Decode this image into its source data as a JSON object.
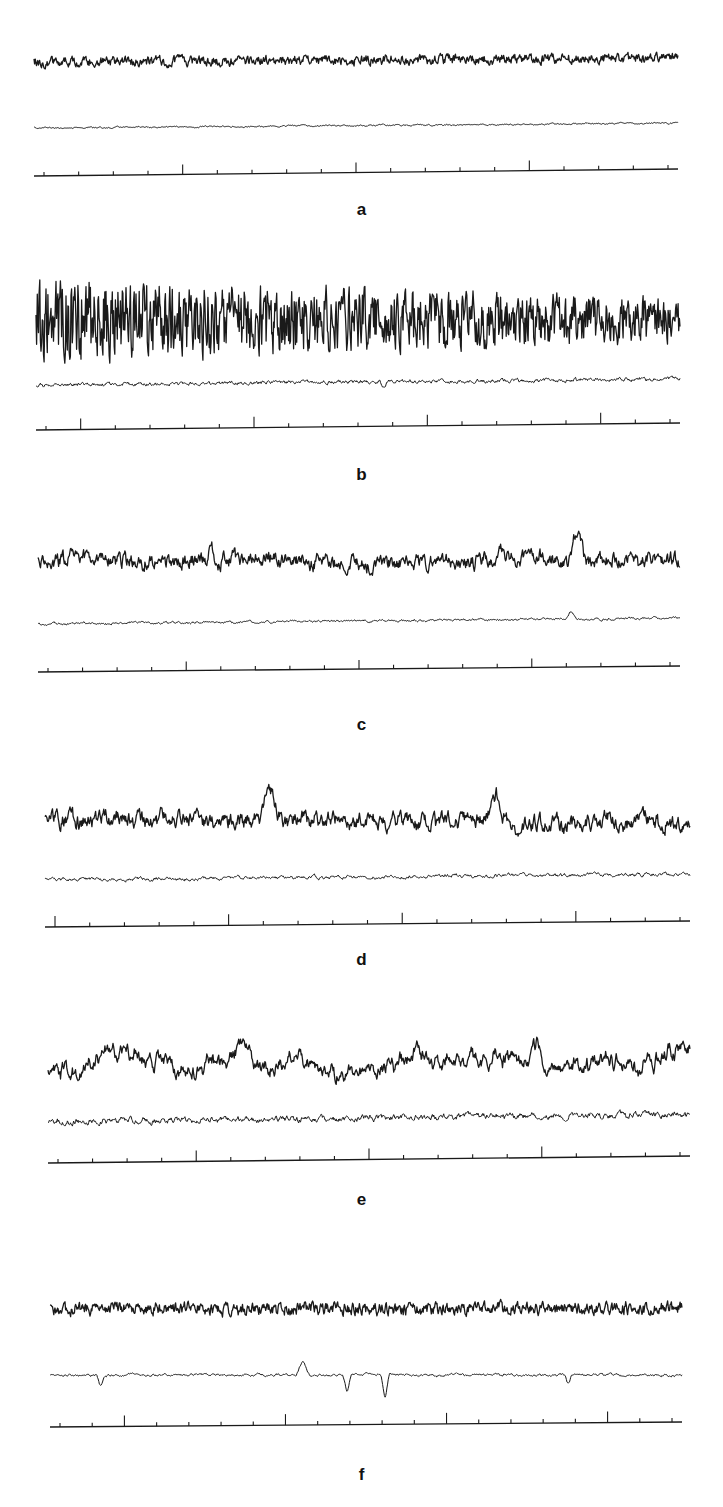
{
  "figure": {
    "panels": [
      {
        "label": "a",
        "top": 40,
        "height": 200,
        "label_y": 160,
        "x0": 34,
        "x1": 678,
        "main": {
          "y": 22,
          "amp": 4,
          "noise": 1.0,
          "freq": 0.9,
          "slow": 0,
          "bursts": [],
          "slope": -4
        },
        "secondary": {
          "y": 88,
          "amp": 1,
          "noise": 0.4,
          "freq": 0.5,
          "bursts": [],
          "slope": -5
        },
        "marker": {
          "y": 136,
          "slope": -7,
          "ticks": 19,
          "major_every": 5,
          "major_offset": 4,
          "tick_h": 4,
          "major_h": 10
        }
      },
      {
        "label": "b",
        "top": 280,
        "height": 210,
        "label_y": 185,
        "x0": 36,
        "x1": 680,
        "main": {
          "y": 40,
          "amp": 20,
          "noise": 1.0,
          "freq": 1.4,
          "slow": 0,
          "bursts": [],
          "slope": 0,
          "decay": 0.5
        },
        "secondary": {
          "y": 105,
          "amp": 2,
          "noise": 0.8,
          "freq": 0.6,
          "bursts": [
            {
              "x": 0.54,
              "amp": -6,
              "w": 0.006
            }
          ],
          "slope": -6
        },
        "marker": {
          "y": 150,
          "slope": -7,
          "ticks": 19,
          "major_every": 5,
          "major_offset": 1,
          "tick_h": 4,
          "major_h": 11
        }
      },
      {
        "label": "c",
        "top": 510,
        "height": 220,
        "label_y": 205,
        "x0": 38,
        "x1": 680,
        "main": {
          "y": 50,
          "amp": 7,
          "noise": 0.8,
          "freq": 0.7,
          "slow": 5,
          "bursts": [
            {
              "x": 0.27,
              "amp": 16,
              "w": 0.008
            },
            {
              "x": 0.72,
              "amp": 12,
              "w": 0.01
            },
            {
              "x": 0.84,
              "amp": 32,
              "w": 0.012
            }
          ],
          "slope": 0
        },
        "secondary": {
          "y": 114,
          "amp": 1.5,
          "noise": 0.5,
          "freq": 0.5,
          "bursts": [
            {
              "x": 0.83,
              "amp": 7,
              "w": 0.008
            }
          ],
          "slope": -6
        },
        "marker": {
          "y": 162,
          "slope": -6,
          "ticks": 19,
          "major_every": 5,
          "major_offset": 4,
          "tick_h": 4,
          "major_h": 9
        }
      },
      {
        "label": "d",
        "top": 790,
        "height": 220,
        "label_y": 160,
        "x0": 45,
        "x1": 690,
        "main": {
          "y": 30,
          "amp": 9,
          "noise": 0.8,
          "freq": 0.6,
          "slow": 6,
          "bursts": [
            {
              "x": 0.35,
              "amp": 26,
              "w": 0.015
            },
            {
              "x": 0.7,
              "amp": 24,
              "w": 0.015
            }
          ],
          "slope": 0
        },
        "secondary": {
          "y": 90,
          "amp": 2.5,
          "noise": 0.6,
          "freq": 0.45,
          "bursts": [],
          "slope": -6
        },
        "marker": {
          "y": 137,
          "slope": -6,
          "ticks": 19,
          "major_every": 5,
          "major_offset": 0,
          "tick_h": 4,
          "major_h": 11
        }
      },
      {
        "label": "e",
        "top": 1030,
        "height": 210,
        "label_y": 160,
        "x0": 48,
        "x1": 690,
        "main": {
          "y": 35,
          "amp": 10,
          "noise": 0.7,
          "freq": 0.45,
          "slow": 14,
          "bursts": [
            {
              "x": 0.3,
              "amp": 22,
              "w": 0.02
            },
            {
              "x": 0.76,
              "amp": 20,
              "w": 0.015
            }
          ],
          "slope": -5
        },
        "secondary": {
          "y": 92,
          "amp": 4,
          "noise": 0.6,
          "freq": 0.5,
          "bursts": [],
          "slope": -8
        },
        "marker": {
          "y": 133,
          "slope": -7,
          "ticks": 19,
          "major_every": 5,
          "major_offset": 4,
          "tick_h": 4,
          "major_h": 11
        }
      },
      {
        "label": "f",
        "top": 1280,
        "height": 220,
        "label_y": 185,
        "x0": 50,
        "x1": 682,
        "main": {
          "y": 30,
          "amp": 5,
          "noise": 1.0,
          "freq": 0.9,
          "slow": 2,
          "bursts": [],
          "slope": -2
        },
        "secondary": {
          "y": 95,
          "amp": 2,
          "noise": 0.4,
          "freq": 0.4,
          "bursts": [
            {
              "x": 0.08,
              "amp": -10,
              "w": 0.006
            },
            {
              "x": 0.4,
              "amp": 12,
              "w": 0.01
            },
            {
              "x": 0.47,
              "amp": -16,
              "w": 0.006
            },
            {
              "x": 0.53,
              "amp": -22,
              "w": 0.006
            },
            {
              "x": 0.82,
              "amp": -8,
              "w": 0.006
            }
          ],
          "slope": 0
        },
        "marker": {
          "y": 147,
          "slope": -5,
          "ticks": 20,
          "major_every": 5,
          "major_offset": 2,
          "tick_h": 4,
          "major_h": 11
        }
      }
    ],
    "style": {
      "trace_color": "#1a1a1a",
      "background": "#ffffff"
    }
  }
}
